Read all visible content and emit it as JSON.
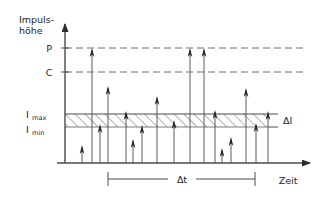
{
  "figure": {
    "colors": {
      "axis": "#4a4a4a",
      "reference_line": "#6e6e6e",
      "pulse_stem": "#5a5a5a",
      "pulse_head": "#262626",
      "hatch": "#555555",
      "text": "#1e1e1e",
      "background": "#ffffff"
    }
  },
  "labels": {
    "y_axis_line1": "Impuls-",
    "y_axis_line2": "höhe",
    "x_axis": "Zeit",
    "level_p": "P",
    "level_c": "C",
    "i_max_main": "I",
    "i_max_sub": "max",
    "i_min_main": "I",
    "i_min_sub": "min",
    "delta_i": "ΔI",
    "delta_t": "Δt"
  },
  "chart_data": {
    "type": "scatter",
    "xlabel": "Zeit",
    "ylabel": "Impuls-höhe",
    "grid": false,
    "legend": null,
    "axis": {
      "x_origin_px": 65,
      "x_end_px": 313,
      "y_top_px": 18,
      "y_baseline_px": 163
    },
    "levels": [
      {
        "name": "P",
        "label": "P",
        "y_px": 48,
        "style": "dashed",
        "x_from_px": 65,
        "x_to_px": 306
      },
      {
        "name": "C",
        "label": "C",
        "y_px": 72,
        "style": "dashed",
        "x_from_px": 65,
        "x_to_px": 306
      }
    ],
    "band": {
      "label_top": "Imax",
      "label_bottom": "Imin",
      "label_right": "ΔI",
      "y_top_px": 114,
      "y_bottom_px": 127,
      "x_from_px": 65,
      "x_to_px": 268,
      "hatched": true,
      "hatch_direction": "up-right"
    },
    "interval": {
      "label": "Δt",
      "x_from_px": 108,
      "x_to_px": 255,
      "y_px": 179
    },
    "pulses": [
      {
        "x_px": 82,
        "tip_y_px": 145,
        "category": "below-band"
      },
      {
        "x_px": 92,
        "tip_y_px": 48,
        "category": "above-P"
      },
      {
        "x_px": 100,
        "tip_y_px": 124,
        "category": "in-band"
      },
      {
        "x_px": 108,
        "tip_y_px": 86,
        "category": "between-C-band"
      },
      {
        "x_px": 126,
        "tip_y_px": 111,
        "category": "at-band-top"
      },
      {
        "x_px": 133,
        "tip_y_px": 139,
        "category": "below-band"
      },
      {
        "x_px": 142,
        "tip_y_px": 125,
        "category": "in-band"
      },
      {
        "x_px": 157,
        "tip_y_px": 96,
        "category": "between-C-band"
      },
      {
        "x_px": 174,
        "tip_y_px": 120,
        "category": "in-band"
      },
      {
        "x_px": 190,
        "tip_y_px": 48,
        "category": "above-P"
      },
      {
        "x_px": 204,
        "tip_y_px": 48,
        "category": "above-P"
      },
      {
        "x_px": 215,
        "tip_y_px": 110,
        "category": "at-band-top"
      },
      {
        "x_px": 222,
        "tip_y_px": 148,
        "category": "below-band"
      },
      {
        "x_px": 231,
        "tip_y_px": 137,
        "category": "below-band"
      },
      {
        "x_px": 246,
        "tip_y_px": 88,
        "category": "between-C-band"
      },
      {
        "x_px": 256,
        "tip_y_px": 123,
        "category": "in-band"
      },
      {
        "x_px": 268,
        "tip_y_px": 111,
        "category": "at-band-top"
      }
    ]
  }
}
